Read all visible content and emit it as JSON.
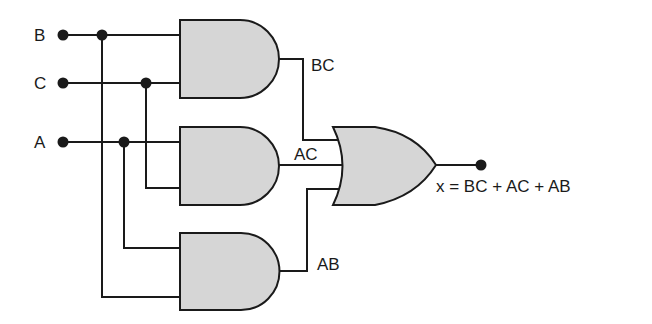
{
  "diagram": {
    "type": "combinational logic circuit",
    "inputs": [
      {
        "name": "B",
        "label": "B"
      },
      {
        "name": "C",
        "label": "C"
      },
      {
        "name": "A",
        "label": "A"
      }
    ],
    "gates": [
      {
        "id": "and1",
        "type": "AND",
        "inputs": [
          "B",
          "C"
        ],
        "output_label": "BC"
      },
      {
        "id": "and2",
        "type": "AND",
        "inputs": [
          "A",
          "C"
        ],
        "output_label": "AC"
      },
      {
        "id": "and3",
        "type": "AND",
        "inputs": [
          "A",
          "B"
        ],
        "output_label": "AB"
      },
      {
        "id": "or1",
        "type": "OR",
        "inputs": [
          "BC",
          "AC",
          "AB"
        ],
        "output_label": "x = BC + AC + AB"
      }
    ],
    "colors": {
      "gate_fill": "#d6d6d6",
      "line": "#1a1a1a",
      "background": "#ffffff"
    }
  }
}
